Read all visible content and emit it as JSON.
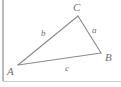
{
  "figure": {
    "type": "geometry-diagram",
    "shape": "triangle",
    "background_color": "#ffffff",
    "stroke_color": "#8a8a8a",
    "label_color": "#6f6f6f",
    "rule_color": "#b9b9b9",
    "width": 121,
    "height": 87,
    "vertices": [
      {
        "name": "A",
        "label": "A",
        "x": 18,
        "y": 65,
        "label_x": 7,
        "label_y": 66,
        "position": "bottom-left"
      },
      {
        "name": "B",
        "label": "B",
        "x": 101,
        "y": 53,
        "label_x": 105,
        "label_y": 52,
        "position": "right"
      },
      {
        "name": "C",
        "label": "C",
        "x": 78,
        "y": 16,
        "label_x": 73,
        "label_y": 2,
        "position": "top"
      }
    ],
    "sides": [
      {
        "name": "a",
        "label": "a",
        "from": "B",
        "to": "C",
        "label_x": 92,
        "label_y": 26
      },
      {
        "name": "b",
        "label": "b",
        "from": "A",
        "to": "C",
        "label_x": 41,
        "label_y": 29
      },
      {
        "name": "c",
        "label": "c",
        "from": "A",
        "to": "B",
        "label_x": 65,
        "label_y": 64
      }
    ],
    "rules": [
      {
        "name": "left-vertical-rule",
        "orientation": "vertical",
        "x1": 3,
        "y1": 0,
        "x2": 3,
        "y2": 81
      },
      {
        "name": "bottom-horizontal-rule",
        "orientation": "horizontal",
        "x1": 3,
        "y1": 81,
        "x2": 121,
        "y2": 81
      }
    ]
  }
}
